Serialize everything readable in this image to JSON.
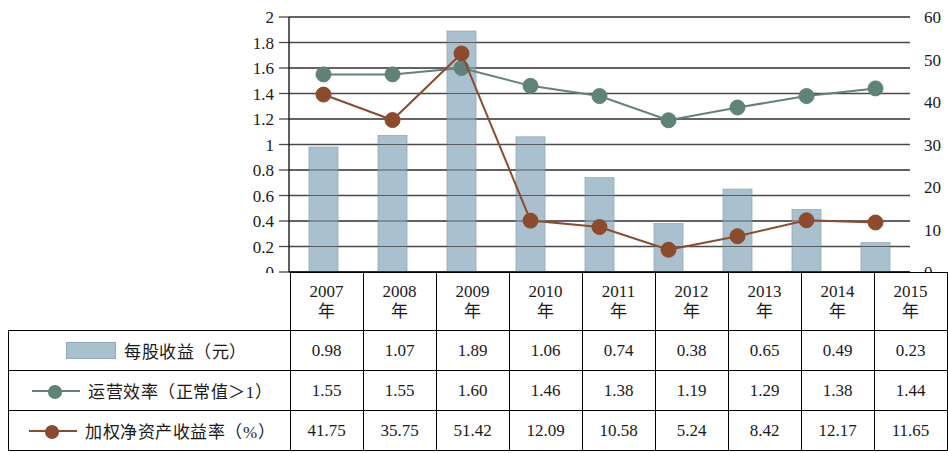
{
  "chart_data": {
    "type": "bar",
    "title": "",
    "xlabel": "",
    "ylabel": "",
    "categories": [
      "2007年",
      "2008年",
      "2009年",
      "2010年",
      "2011年",
      "2012年",
      "2013年",
      "2014年",
      "2015年"
    ],
    "category_lines": [
      [
        "2007",
        "年"
      ],
      [
        "2008",
        "年"
      ],
      [
        "2009",
        "年"
      ],
      [
        "2010",
        "年"
      ],
      [
        "2011",
        "年"
      ],
      [
        "2012",
        "年"
      ],
      [
        "2013",
        "年"
      ],
      [
        "2014",
        "年"
      ],
      [
        "2015",
        "年"
      ]
    ],
    "grid": true,
    "legend_position": "bottom-table",
    "axes": {
      "left": {
        "min": 0,
        "max": 2,
        "step": 0.2,
        "ticks": [
          "0",
          "0.2",
          "0.4",
          "0.6",
          "0.8",
          "1",
          "1.2",
          "1.4",
          "1.6",
          "1.8",
          "2"
        ]
      },
      "right": {
        "min": 0,
        "max": 60,
        "step": 10,
        "minor_step": 5,
        "ticks": [
          "0",
          "10",
          "20",
          "30",
          "40",
          "50",
          "60"
        ]
      }
    },
    "series": [
      {
        "name": "每股收益（元）",
        "type": "bar",
        "axis": "left",
        "color": "#a9c1cf",
        "values": [
          0.98,
          1.07,
          1.89,
          1.06,
          0.74,
          0.38,
          0.65,
          0.49,
          0.23
        ],
        "labels": [
          "0.98",
          "1.07",
          "1.89",
          "1.06",
          "0.74",
          "0.38",
          "0.65",
          "0.49",
          "0.23"
        ]
      },
      {
        "name": "运营效率（正常值＞1）",
        "type": "line",
        "axis": "left",
        "color": "#5f8379",
        "values": [
          1.55,
          1.55,
          1.6,
          1.46,
          1.38,
          1.19,
          1.29,
          1.38,
          1.44
        ],
        "labels": [
          "1.55",
          "1.55",
          "1.60",
          "1.46",
          "1.38",
          "1.19",
          "1.29",
          "1.38",
          "1.44"
        ]
      },
      {
        "name": "加权净资产收益率（%）",
        "type": "line",
        "axis": "right",
        "color": "#8c4b2c",
        "values": [
          41.75,
          35.75,
          51.42,
          12.09,
          10.58,
          5.24,
          8.42,
          12.17,
          11.65
        ],
        "labels": [
          "41.75",
          "35.75",
          "51.42",
          "12.09",
          "10.58",
          "5.24",
          "8.42",
          "12.17",
          "11.65"
        ]
      }
    ]
  },
  "table": {
    "legend_rows": [
      {
        "label": "每股收益（元）",
        "swatch": "bar",
        "color": "#a9c1cf"
      },
      {
        "label": "运营效率（正常值＞1）",
        "swatch": "line",
        "color": "#5f8379"
      },
      {
        "label": "加权净资产收益率（%）",
        "swatch": "line",
        "color": "#8c4b2c"
      }
    ]
  },
  "colors": {
    "bar": "#a9c1cf",
    "bar_edge": "#8fa9b8",
    "line_efficiency": "#5f8379",
    "line_roe": "#8c4b2c",
    "grid": "#4a4a4a",
    "axis": "#1a1a1a",
    "background": "#ffffff"
  }
}
